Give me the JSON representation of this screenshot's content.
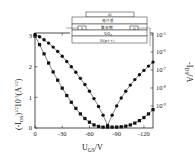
{
  "chart_data": {
    "type": "line",
    "title": "",
    "xlabel": "U_GS/V",
    "ylabel_left": "(-I_DS)^(1/2) 10^-3 (A^(1/2))",
    "ylabel_right": "-I_DS/A",
    "xlim": [
      0,
      -130
    ],
    "ylim_left": [
      0,
      3.1
    ],
    "ylim_right_log": [
      -9.5,
      -5
    ],
    "x_ticks": [
      "0",
      "-30",
      "-60",
      "-90",
      "-120"
    ],
    "x_tick_values": [
      0,
      -30,
      -60,
      -90,
      -120
    ],
    "y_left_ticks": [
      "0",
      "1",
      "2",
      "3"
    ],
    "y_left_tick_values": [
      0,
      1,
      2,
      3
    ],
    "y_right_ticks": [
      "10^-5",
      "10^-6",
      "10^-7",
      "10^-8",
      "10^-9"
    ],
    "y_right_tick_exponents": [
      -5,
      -6,
      -7,
      -8,
      -9
    ],
    "grid": false,
    "legend": "none",
    "series": [
      {
        "name": "sqrt(-I_DS)",
        "axis": "left",
        "marker": "square",
        "x": [
          0,
          -5,
          -10,
          -15,
          -20,
          -25,
          -30,
          -35,
          -40,
          -45,
          -50,
          -55,
          -60,
          -65,
          -70,
          -75,
          -80,
          -85,
          -90,
          -95,
          -100,
          -105,
          -110,
          -115,
          -120,
          -125,
          -130
        ],
        "values": [
          3.0,
          2.72,
          2.42,
          2.12,
          1.83,
          1.56,
          1.3,
          1.06,
          0.84,
          0.64,
          0.46,
          0.31,
          0.19,
          0.1,
          0.05,
          0.03,
          0.03,
          0.03,
          0.03,
          0.04,
          0.06,
          0.1,
          0.16,
          0.24,
          0.34,
          0.46,
          0.6
        ]
      },
      {
        "name": "-I_DS (log)",
        "axis": "right",
        "marker": "circle",
        "x": [
          0,
          -5,
          -10,
          -15,
          -20,
          -25,
          -30,
          -35,
          -40,
          -45,
          -50,
          -55,
          -60,
          -65,
          -70,
          -75,
          -80,
          -85,
          -90,
          -95,
          -100,
          -105,
          -110,
          -115,
          -120,
          -125,
          -130
        ],
        "values_left_scale": [
          3.05,
          2.98,
          2.88,
          2.77,
          2.64,
          2.5,
          2.34,
          2.17,
          2.0,
          1.82,
          1.62,
          1.42,
          1.2,
          0.96,
          0.7,
          0.42,
          0.08,
          0.42,
          0.72,
          0.98,
          1.2,
          1.4,
          1.58,
          1.74,
          1.88,
          2.02,
          2.15
        ]
      }
    ],
    "inset": {
      "description": "device cross-section",
      "layers": [
        "Al",
        "电介质",
        "聚合物",
        "SiO2",
        "Si(p++)"
      ],
      "contacts": [
        "S",
        "D"
      ]
    }
  },
  "labels": {
    "x_axis": "U",
    "x_axis_sub": "GS",
    "x_axis_unit": "/V",
    "y_left_prefix": "(-I",
    "y_left_sub": "DS",
    "y_left_suffix": ")",
    "y_left_exp": "1/2",
    "y_left_mid": "10",
    "y_left_mid_exp": "-3",
    "y_left_unit": "(A",
    "y_left_unit_exp": "1/2",
    "y_left_close": ")",
    "y_right_prefix": "-I",
    "y_right_sub": "DS",
    "y_right_unit": "/A",
    "inset_gate": "Al",
    "inset_dielectric": "电介质",
    "inset_polymer": "聚合物",
    "inset_source": "S",
    "inset_drain": "D",
    "inset_oxide": "SiO",
    "inset_oxide_sub": "2",
    "inset_substrate": "Si(p++)"
  }
}
